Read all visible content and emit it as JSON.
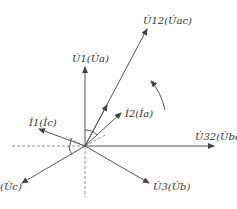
{
  "diagram": {
    "type": "phasor-diagram",
    "origin": {
      "x": 85,
      "y": 146
    },
    "vectors": [
      {
        "id": "U1",
        "label_main": "U",
        "label_sub": "1",
        "label_alt": "U",
        "label_alt_sub": "a",
        "end": [
          85,
          67
        ]
      },
      {
        "id": "U12",
        "label_main": "U",
        "label_sub": "12",
        "label_alt": "U",
        "label_alt_sub": "ac",
        "end": [
          147,
          29
        ]
      },
      {
        "id": "I2",
        "label_main": "I",
        "label_sub": "2",
        "label_alt": "I",
        "label_alt_sub": "a",
        "end": [
          121,
          113
        ]
      },
      {
        "id": "U32",
        "label_main": "U",
        "label_sub": "32",
        "label_alt": "U",
        "label_alt_sub": "bc",
        "end": [
          214,
          146
        ]
      },
      {
        "id": "U3",
        "label_main": "U",
        "label_sub": "3",
        "label_alt": "U",
        "label_alt_sub": "b",
        "end": [
          149,
          183
        ]
      },
      {
        "id": "Uc",
        "label_main": "",
        "label_sub": "",
        "label_alt": "U",
        "label_alt_sub": "c",
        "end": [
          22,
          183
        ]
      },
      {
        "id": "I1",
        "label_main": "I",
        "label_sub": "1",
        "label_alt": "I",
        "label_alt_sub": "c",
        "end": [
          39,
          129
        ]
      }
    ],
    "labels": {
      "U12": "U̇12(U̇ac)",
      "U1": "U̇1(U̇a)",
      "I2": "İ2(İa)",
      "I1": "İ1(İc)",
      "U32": "U̇32(U̇bc)",
      "U3": "U̇3(U̇b)",
      "Uc": "(U̇c)"
    },
    "rotation_arrow": "counter-clockwise",
    "colors": {
      "line": "#555555",
      "text": "#333333",
      "background": "#ffffff"
    }
  }
}
